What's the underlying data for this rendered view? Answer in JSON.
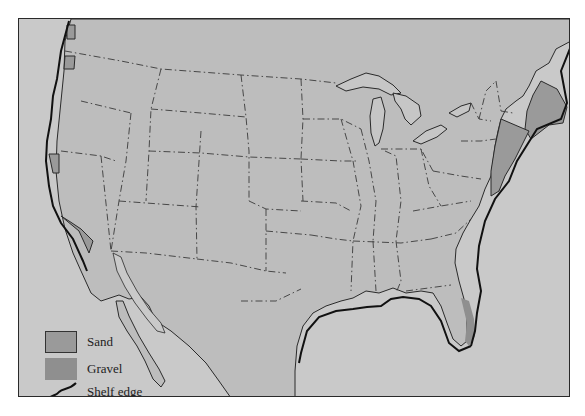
{
  "map": {
    "subject": "Offshore sand and gravel deposits, conterminous United States",
    "colors": {
      "ocean": "#c9c9c9",
      "land": "#bdbdbd",
      "lakes": "#c6c6c6",
      "sand": "#9a9a9a",
      "gravel": "#8f8f8f",
      "shelf_edge": "#111111",
      "state_border": "#3a3a3a"
    },
    "deposits": [
      {
        "type": "Sand",
        "region": "Washington / Oregon coast"
      },
      {
        "type": "Sand",
        "region": "Northern California coast"
      },
      {
        "type": "Sand",
        "region": "Southern California coast"
      },
      {
        "type": "Sand",
        "region": "New England / Gulf of Maine"
      },
      {
        "type": "Sand",
        "region": "Mid-Atlantic coast (New York to Virginia)"
      },
      {
        "type": "Gravel",
        "region": "Southeast Florida coast"
      }
    ]
  },
  "legend": {
    "items": [
      {
        "label": "Sand",
        "symbol": "sand-swatch"
      },
      {
        "label": "Gravel",
        "symbol": "gravel-swatch"
      },
      {
        "label": "Shelf edge",
        "symbol": "shelf-edge-line"
      }
    ]
  }
}
